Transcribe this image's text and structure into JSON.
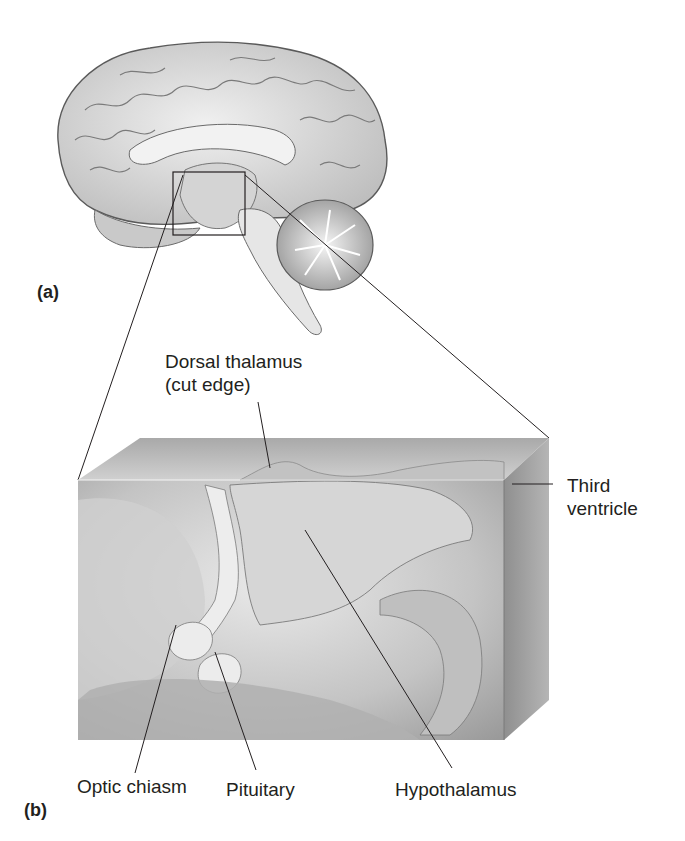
{
  "figure": {
    "panels": [
      {
        "id": "a",
        "label": "(a)",
        "description": "Midsagittal view of human brain with inset box around hypothalamic region"
      },
      {
        "id": "b",
        "label": "(b)",
        "description": "Enlarged 3D block view of the boxed region"
      }
    ],
    "labels": {
      "dorsal_thalamus_line1": "Dorsal thalamus",
      "dorsal_thalamus_line2": "(cut edge)",
      "third_ventricle_line1": "Third",
      "third_ventricle_line2": "ventricle",
      "optic_chiasm": "Optic chiasm",
      "pituitary": "Pituitary",
      "hypothalamus": "Hypothalamus"
    },
    "colors": {
      "background": "#ffffff",
      "line": "#231f20",
      "tissue_light": "#e6e6e6",
      "tissue_mid": "#bdbdbd",
      "tissue_dark": "#8a8a8a"
    }
  }
}
